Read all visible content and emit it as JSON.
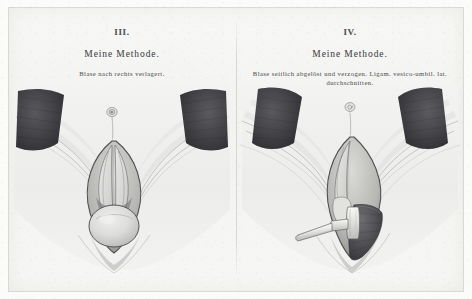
{
  "plate": {
    "background_color": "#f6f6f4",
    "ink_color": "#54545a",
    "medium": "engraving"
  },
  "panels": [
    {
      "roman": "III.",
      "method_title": "Meine Methode.",
      "caption": "Blase nach rechts verlagert.",
      "figure": {
        "name": "abdominal-incision-bladder-displaced-right",
        "umbilicus": "umbilicus-spiral",
        "structures": [
          "left-thigh-drape",
          "right-thigh-drape",
          "median-incision-opening",
          "exposed-bladder",
          "retracted-fascia-flaps"
        ]
      }
    },
    {
      "roman": "IV.",
      "method_title": "Meine Methode.",
      "caption": "Blase seitlich abgelöst und verzogen. Ligam. vesico-umbil. lat. durchschnitten.",
      "figure": {
        "name": "abdominal-incision-bladder-detached-retracted",
        "umbilicus": "umbilicus-spiral",
        "structures": [
          "left-thigh-drape",
          "right-thigh-drape",
          "median-incision-opening",
          "displaced-bladder-dark",
          "surgical-retractor",
          "severed-ligament"
        ]
      }
    }
  ]
}
